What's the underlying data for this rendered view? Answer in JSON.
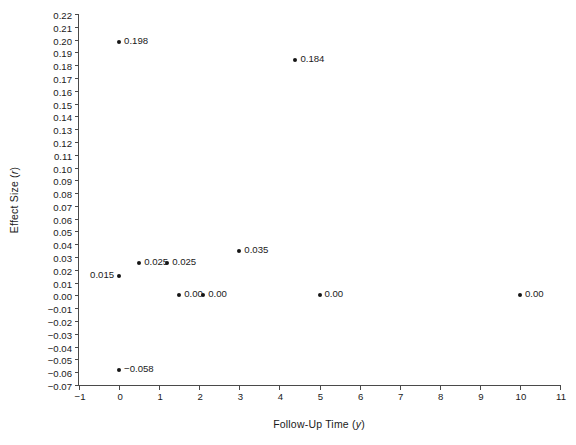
{
  "chart_data": {
    "type": "scatter",
    "title": "",
    "xlabel": "Follow-Up Time (y)",
    "xlabel_main": "Follow-Up Time (",
    "xlabel_italic": "y",
    "xlabel_tail": ")",
    "ylabel": "Effect Size (r)",
    "ylabel_main": "Effect Size (",
    "ylabel_italic": "r",
    "ylabel_tail": ")",
    "xlim": [
      -1,
      11
    ],
    "ylim": [
      -0.07,
      0.22
    ],
    "grid": false,
    "legend": null,
    "xticks": [
      -1,
      0,
      1,
      2,
      3,
      4,
      5,
      6,
      7,
      8,
      9,
      10,
      11
    ],
    "xtick_labels": [
      "−1",
      "0",
      "1",
      "2",
      "3",
      "4",
      "5",
      "6",
      "7",
      "8",
      "9",
      "10",
      "11"
    ],
    "yticks": [
      0.22,
      0.21,
      0.2,
      0.19,
      0.18,
      0.17,
      0.16,
      0.15,
      0.14,
      0.13,
      0.12,
      0.11,
      0.1,
      0.09,
      0.08,
      0.07,
      0.06,
      0.05,
      0.04,
      0.03,
      0.02,
      0.01,
      0.0,
      -0.01,
      -0.02,
      -0.03,
      -0.04,
      -0.05,
      -0.06,
      -0.07
    ],
    "ytick_labels": [
      "0.22",
      "0.21",
      "0.20",
      "0.19",
      "0.18",
      "0.17",
      "0.16",
      "0.15",
      "0.14",
      "0.13",
      "0.12",
      "0.11",
      "0.10",
      "0.09",
      "0.08",
      "0.07",
      "0.06",
      "0.05",
      "0.04",
      "0.03",
      "0.02",
      "0.01",
      "0.00",
      "−0.01",
      "−0.02",
      "−0.03",
      "−0.04",
      "−0.05",
      "−0.06",
      "−0.07"
    ],
    "marker": "filled-circle",
    "marker_color": "#161616",
    "points": [
      {
        "x": 0,
        "y": 0.198,
        "label": "0.198",
        "label_side": "right"
      },
      {
        "x": 4.4,
        "y": 0.184,
        "label": "0.184",
        "label_side": "right"
      },
      {
        "x": 3,
        "y": 0.035,
        "label": "0.035",
        "label_side": "right"
      },
      {
        "x": 0.5,
        "y": 0.025,
        "label": "0.025",
        "label_side": "right"
      },
      {
        "x": 1.2,
        "y": 0.025,
        "label": "0.025",
        "label_side": "right"
      },
      {
        "x": 0,
        "y": 0.015,
        "label": "0.015",
        "label_side": "left"
      },
      {
        "x": 1.5,
        "y": 0.0,
        "label": "0.00",
        "label_side": "right"
      },
      {
        "x": 2.1,
        "y": 0.0,
        "label": "0.00",
        "label_side": "right"
      },
      {
        "x": 5,
        "y": 0.0,
        "label": "0.00",
        "label_side": "right"
      },
      {
        "x": 10,
        "y": 0.0,
        "label": "0.00",
        "label_side": "right"
      },
      {
        "x": 0,
        "y": -0.058,
        "label": "−0.058",
        "label_side": "right"
      }
    ]
  }
}
